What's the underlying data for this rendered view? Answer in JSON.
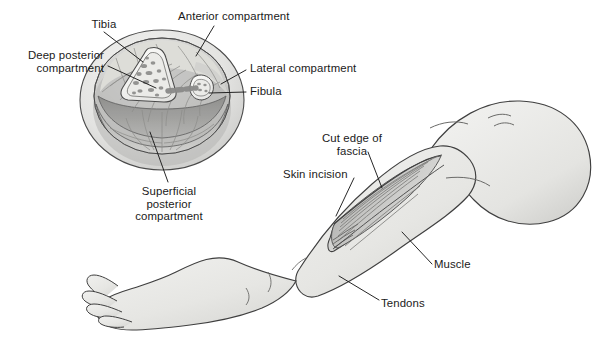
{
  "figure": {
    "background_color": "#ffffff",
    "ink_color": "#1a1a1a",
    "skin_fill": "#e8e8e6",
    "muscle_fill": "#cfcfcf",
    "bone_fill": "#f2f2f0",
    "deep_shade": "#a9a9a9"
  },
  "cross_section": {
    "name": "Leg cross-section",
    "structures": [
      "tibia",
      "fibula",
      "interosseous-membrane",
      "anterior-compartment",
      "lateral-compartment",
      "deep-posterior-compartment",
      "superficial-posterior-compartment",
      "fascial-ring"
    ]
  },
  "limb": {
    "name": "Lower limb with fasciotomy",
    "structures": [
      "foot",
      "ankle",
      "shin",
      "knee",
      "thigh",
      "skin-incision",
      "cut-edge-of-fascia",
      "muscle-belly",
      "tendons"
    ]
  },
  "labels": [
    {
      "id": "tibia",
      "lines": [
        "Tibia"
      ],
      "align": "center",
      "x": 80,
      "y": 18,
      "width": 48
    },
    {
      "id": "anterior-compartment",
      "lines": [
        "Anterior compartment"
      ],
      "align": "left",
      "x": 178,
      "y": 10,
      "width": 140
    },
    {
      "id": "deep-posterior-compartment",
      "lines": [
        "Deep posterior",
        "compartment"
      ],
      "align": "right",
      "x": 8,
      "y": 49,
      "width": 96
    },
    {
      "id": "lateral-compartment",
      "lines": [
        "Lateral compartment"
      ],
      "align": "left",
      "x": 250,
      "y": 62,
      "width": 130
    },
    {
      "id": "fibula",
      "lines": [
        "Fibula"
      ],
      "align": "left",
      "x": 250,
      "y": 85,
      "width": 50
    },
    {
      "id": "superficial-posterior-compartment",
      "lines": [
        "Superficial",
        "posterior",
        "compartment"
      ],
      "align": "center",
      "x": 122,
      "y": 185,
      "width": 94
    },
    {
      "id": "cut-edge-of-fascia",
      "lines": [
        "Cut edge of",
        "fascia"
      ],
      "align": "center",
      "x": 310,
      "y": 132,
      "width": 84
    },
    {
      "id": "skin-incision",
      "lines": [
        "Skin incision"
      ],
      "align": "left",
      "x": 283,
      "y": 168,
      "width": 80
    },
    {
      "id": "muscle",
      "lines": [
        "Muscle"
      ],
      "align": "left",
      "x": 434,
      "y": 258,
      "width": 50
    },
    {
      "id": "tendons",
      "lines": [
        "Tendons"
      ],
      "align": "left",
      "x": 381,
      "y": 297,
      "width": 56
    }
  ],
  "leader_lines": [
    {
      "id": "tibia",
      "points": "104,32 143,62"
    },
    {
      "id": "anterior-compartment",
      "points": "214,26 196,56"
    },
    {
      "id": "deep-posterior-compartment",
      "points": "108,66 156,88"
    },
    {
      "id": "lateral-compartment",
      "points": "246,70 221,84"
    },
    {
      "id": "fibula",
      "points": "246,92 209,93"
    },
    {
      "id": "superficial-posterior-compartment",
      "points": "168,182 150,132"
    },
    {
      "id": "cut-edge-of-fascia",
      "points": "368,152 382,188"
    },
    {
      "id": "skin-incision",
      "points": "354,178 336,216"
    },
    {
      "id": "muscle",
      "points": "432,264 402,232"
    },
    {
      "id": "tendons",
      "points": "379,300 339,276"
    }
  ]
}
